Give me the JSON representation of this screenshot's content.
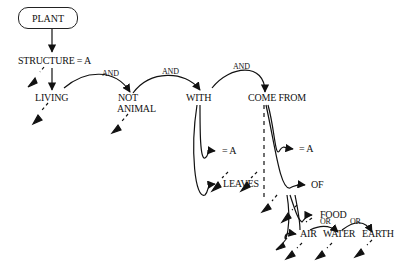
{
  "diagram": {
    "root": "PLANT",
    "nodes": {
      "structure": "STRUCTURE = A",
      "living": "LIVING",
      "not": "NOT",
      "animal": "ANIMAL",
      "with": "WITH",
      "come_from": "COME FROM",
      "with_eq": "= A",
      "come_eq": "= A",
      "leaves": "LEAVES",
      "of": "OF",
      "food": "FOOD",
      "air": "AIR",
      "water": "WATER",
      "earth": "EARTH"
    },
    "connectors": {
      "and1": "AND",
      "and2": "AND",
      "and3": "AND",
      "or1": "OR",
      "or2": "OR"
    }
  }
}
